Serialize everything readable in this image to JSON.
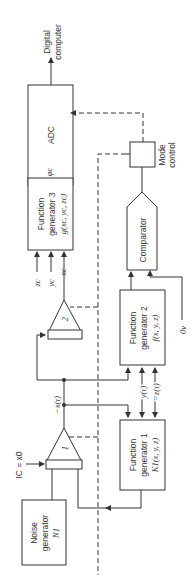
{
  "diagram": {
    "orientation": "rotated-90-ccw",
    "output": {
      "line1": "Digital",
      "line2": "computer"
    },
    "adc": {
      "label": "ADC"
    },
    "mode_control": {
      "line1": "Mode",
      "line2": "control"
    },
    "function_generator_3": {
      "line1": "Function",
      "line2": "generator 3",
      "line3": "g(xc, yc, zc)"
    },
    "phi_c": "φc",
    "inputs_fg3": [
      "zc",
      "yc",
      "xc"
    ],
    "comparator": {
      "label": "Comparator"
    },
    "amplifier_2": {
      "label": "2"
    },
    "function_generator_2": {
      "line1": "Function",
      "line2": "generator 2",
      "line3": "f(x, y, z)"
    },
    "zero_v": "0v",
    "neg_x_tau": "−x(τ)",
    "y_tau": "y(τ)",
    "neg_z_tau": "−z(τ)",
    "amplifier_1": {
      "label": "1"
    },
    "function_generator_1": {
      "line1": "Function",
      "line2": "generator 1",
      "line3": "K1(x, y, z)"
    },
    "initial_condition": "IC = x0",
    "noise_generator": {
      "line1": "Noise",
      "line2": "generator",
      "line3": "N1"
    }
  }
}
